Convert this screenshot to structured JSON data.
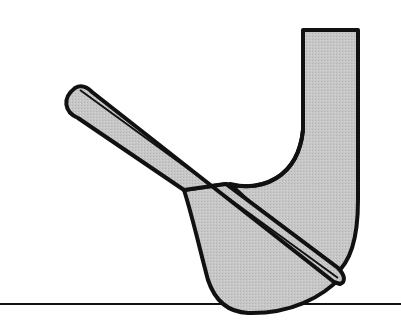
{
  "diagram": {
    "colors": {
      "background": "#ffffff",
      "fill": "#c8c8c8",
      "outline": "#111111"
    },
    "parts": [
      {
        "name": "hosel-shaft"
      },
      {
        "name": "clubhead-body"
      },
      {
        "name": "leading-edge-blade"
      },
      {
        "name": "ground-line"
      }
    ]
  }
}
